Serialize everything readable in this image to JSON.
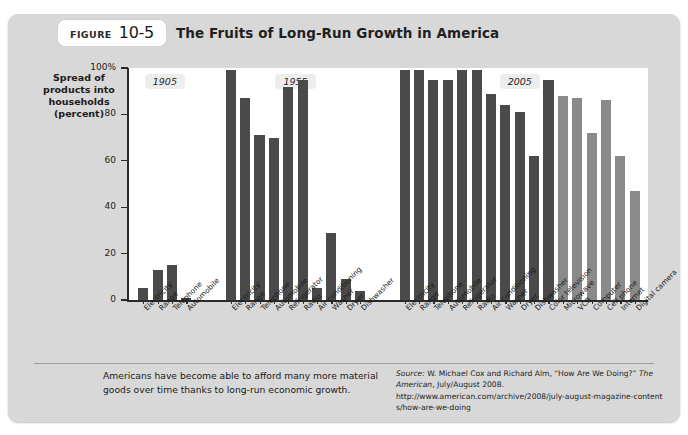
{
  "figure": {
    "badge_label": "FIGURE",
    "badge_number": "10-5",
    "title": "The Fruits of Long-Run Growth in America"
  },
  "axis": {
    "y_title_lines": [
      "Spread of",
      "products into",
      "households",
      "(percent)"
    ],
    "y_ticks": [
      "100%",
      "80",
      "60",
      "40",
      "20",
      "0"
    ]
  },
  "caption": "Americans have become able to afford many more material goods over time thanks to long-run economic growth.",
  "source": {
    "label": "Source:",
    "line1_a": " W. Michael Cox and Richard Alm, “How Are We Doing?” ",
    "line1_b": "The American",
    "line1_c": ", July/August 2008.",
    "line2": "http://www.american.com/archive/2008/july-august-magazine-contents/how-are-we-doing"
  },
  "colors": {
    "card_bg": "#d8d8d8",
    "plot_bg": "#ffffff",
    "bar_dark": "#4a4a4a",
    "bar_light": "#8a8a8a",
    "axis": "#2a2a2a"
  },
  "chart_data": {
    "type": "bar",
    "title": "The Fruits of Long-Run Growth in America",
    "xlabel": "",
    "ylabel": "Spread of products into households (percent)",
    "ylim": [
      0,
      100
    ],
    "grid": false,
    "legend": "none",
    "groups": [
      {
        "year": "1905",
        "categories": [
          "Electricity",
          "Range",
          "Telephone",
          "Automobile"
        ],
        "values": [
          5,
          13,
          15,
          1
        ],
        "colors": [
          "#4a4a4a",
          "#4a4a4a",
          "#4a4a4a",
          "#4a4a4a"
        ]
      },
      {
        "year": "1955",
        "categories": [
          "Electricity",
          "Range",
          "Telephone",
          "Automobile",
          "Refrigerator",
          "Radio",
          "Air conditioning",
          "Washer",
          "Dryer",
          "Dishwasher"
        ],
        "values": [
          99,
          87,
          71,
          70,
          92,
          95,
          5,
          29,
          9,
          4
        ],
        "colors": [
          "#4a4a4a",
          "#4a4a4a",
          "#4a4a4a",
          "#4a4a4a",
          "#4a4a4a",
          "#4a4a4a",
          "#4a4a4a",
          "#4a4a4a",
          "#4a4a4a",
          "#4a4a4a"
        ]
      },
      {
        "year": "2005",
        "categories": [
          "Electricity",
          "Range",
          "Telephone",
          "Automobile",
          "Refrigerator",
          "Radio",
          "Air conditioning",
          "Washer",
          "Dryer",
          "Dishwasher",
          "Color television",
          "Microwave",
          "VCR",
          "Computer",
          "Cell phone",
          "Internet",
          "Digital camera"
        ],
        "values": [
          99,
          99,
          95,
          95,
          99,
          99,
          89,
          84,
          81,
          62,
          95,
          88,
          87,
          72,
          86,
          62,
          47
        ],
        "colors": [
          "#4a4a4a",
          "#4a4a4a",
          "#4a4a4a",
          "#4a4a4a",
          "#4a4a4a",
          "#4a4a4a",
          "#4a4a4a",
          "#4a4a4a",
          "#4a4a4a",
          "#4a4a4a",
          "#4a4a4a",
          "#8a8a8a",
          "#8a8a8a",
          "#8a8a8a",
          "#8a8a8a",
          "#8a8a8a",
          "#8a8a8a"
        ]
      }
    ]
  }
}
